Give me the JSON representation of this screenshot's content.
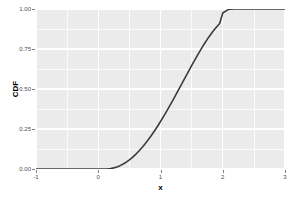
{
  "chart_data": {
    "type": "line",
    "title": "",
    "subtitle": "",
    "xlabel": "x",
    "ylabel": "CDF",
    "xlim": [
      -1,
      3
    ],
    "ylim": [
      0,
      1
    ],
    "grid": true,
    "legend": null,
    "x_ticks": [
      {
        "value": -1,
        "label": "-1"
      },
      {
        "value": 0,
        "label": "0"
      },
      {
        "value": 1,
        "label": "1"
      },
      {
        "value": 2,
        "label": "2"
      },
      {
        "value": 3,
        "label": "3"
      }
    ],
    "x_minor_ticks": [
      -0.5,
      0.5,
      1.5,
      2.5
    ],
    "y_ticks": [
      {
        "value": 0.0,
        "label": "0.00"
      },
      {
        "value": 0.25,
        "label": "0.25"
      },
      {
        "value": 0.5,
        "label": "0.50"
      },
      {
        "value": 0.75,
        "label": "0.75"
      },
      {
        "value": 1.0,
        "label": "1.00"
      }
    ],
    "y_minor_ticks": [
      0.125,
      0.375,
      0.625,
      0.875
    ],
    "series": [
      {
        "name": "CDF",
        "color": "#3b3b3b",
        "line_width": 1.6,
        "x": [
          -1.0,
          -0.9,
          -0.8,
          -0.7,
          -0.6,
          -0.5,
          -0.4,
          -0.3,
          -0.2,
          -0.1,
          0.0,
          0.05,
          0.1,
          0.15,
          0.2,
          0.25,
          0.3,
          0.35,
          0.4,
          0.45,
          0.5,
          0.55,
          0.6,
          0.65,
          0.7,
          0.75,
          0.8,
          0.85,
          0.9,
          0.95,
          1.0,
          1.05,
          1.1,
          1.15,
          1.2,
          1.25,
          1.3,
          1.35,
          1.4,
          1.45,
          1.5,
          1.55,
          1.6,
          1.65,
          1.7,
          1.75,
          1.8,
          1.85,
          1.9,
          1.95,
          2.0,
          2.1,
          2.2,
          2.3,
          2.4,
          2.5,
          2.6,
          2.7,
          2.8,
          2.9,
          3.0
        ],
        "y": [
          0.0,
          0.0,
          0.0,
          0.0,
          0.0,
          0.0,
          0.0,
          0.0,
          0.0,
          0.0,
          0.0,
          0.0,
          0.0,
          0.001,
          0.003,
          0.007,
          0.013,
          0.021,
          0.031,
          0.043,
          0.057,
          0.073,
          0.091,
          0.111,
          0.133,
          0.156,
          0.181,
          0.208,
          0.236,
          0.266,
          0.297,
          0.329,
          0.362,
          0.396,
          0.431,
          0.466,
          0.502,
          0.538,
          0.574,
          0.61,
          0.646,
          0.681,
          0.715,
          0.748,
          0.78,
          0.81,
          0.838,
          0.864,
          0.888,
          0.909,
          0.975,
          0.999,
          1.0,
          1.0,
          1.0,
          1.0,
          1.0,
          1.0,
          1.0,
          1.0,
          1.0
        ]
      }
    ],
    "panel_background": "#ebebeb",
    "gridline_color": "#ffffff",
    "tick_label_color": "#4d4d4d",
    "axis_title_color": "#000000"
  }
}
